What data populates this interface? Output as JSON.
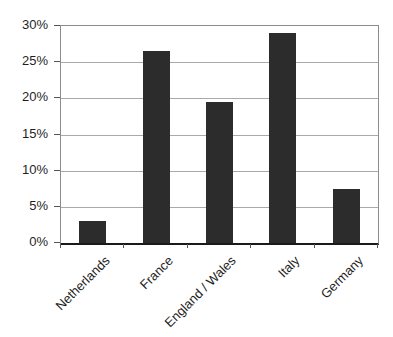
{
  "colors": {
    "background": "#ffffff",
    "bar": "#2c2c2c",
    "gridline": "#a9a9a9",
    "plot_border": "#8c8c8c",
    "axis": "#1a1a1a",
    "tick": "#555555",
    "text": "#1f1f1f"
  },
  "chart_data": {
    "type": "bar",
    "title": "",
    "xlabel": "",
    "ylabel": "",
    "categories": [
      "Netherlands",
      "France",
      "England / Wales",
      "Italy",
      "Germany"
    ],
    "values": [
      3,
      26.5,
      19.5,
      29,
      7.5
    ],
    "ylim": [
      0,
      30
    ],
    "ytick_step": 5,
    "ytick_labels": [
      "0%",
      "5%",
      "10%",
      "15%",
      "20%",
      "25%",
      "30%"
    ],
    "grid": true,
    "legend": "none",
    "bar_width_fraction": 0.42
  }
}
